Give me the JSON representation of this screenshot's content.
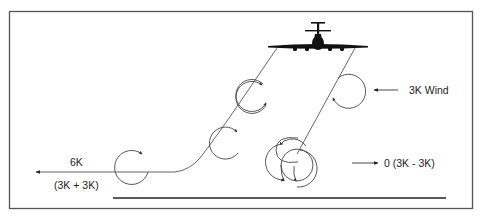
{
  "figure": {
    "type": "wake-turbulence-crosswind-diagram",
    "colors": {
      "background": "#ffffff",
      "frame": "#555555",
      "lines": "#444444",
      "aircraft": "#111111",
      "ground": "#222222"
    }
  },
  "labels": {
    "wind": "3K Wind",
    "upwind_vortex_speed": "0 (3K - 3K)",
    "downwind_vortex_speed": "6K",
    "downwind_vortex_formula": "(3K + 3K)"
  },
  "elements": {
    "aircraft": "airplane-front-view",
    "wind_arrow_direction": "left",
    "upwind_arrow_direction": "right",
    "downwind_arrow_direction": "left",
    "vortex_count_left_trail": 3,
    "vortex_count_right_trail": 4
  }
}
